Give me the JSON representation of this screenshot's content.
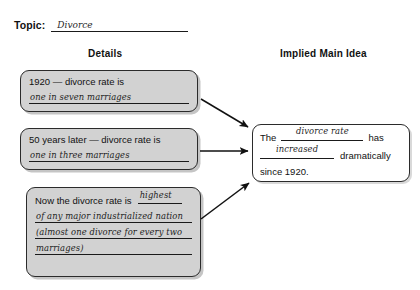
{
  "topic": {
    "label": "Topic:",
    "answer": "Divorce"
  },
  "headings": {
    "details": "Details",
    "main_idea": "Implied Main Idea"
  },
  "details": [
    {
      "prompt": "1920 — divorce rate is",
      "answers": [
        "one in seven marriages"
      ]
    },
    {
      "prompt": "50 years later — divorce rate is",
      "answers": [
        "one in three marriages"
      ]
    },
    {
      "prompt": "Now the divorce rate is",
      "inline_answer": "highest",
      "answers": [
        "of any major industrialized nation",
        "(almost one divorce for every two",
        "marriages)"
      ]
    }
  ],
  "main_idea": {
    "text_1": "The",
    "blank_1": "divorce rate",
    "text_2": "has",
    "blank_2": "increased",
    "text_3": "dramatically",
    "text_4": "since 1920."
  },
  "arrows": [
    {
      "name": "arrow-detail-1-to-main"
    },
    {
      "name": "arrow-detail-2-to-main"
    },
    {
      "name": "arrow-detail-3-to-main"
    }
  ],
  "colors": {
    "ink": "#1a1a1a",
    "box_fill": "#d2d2d2",
    "page": "#ffffff"
  }
}
